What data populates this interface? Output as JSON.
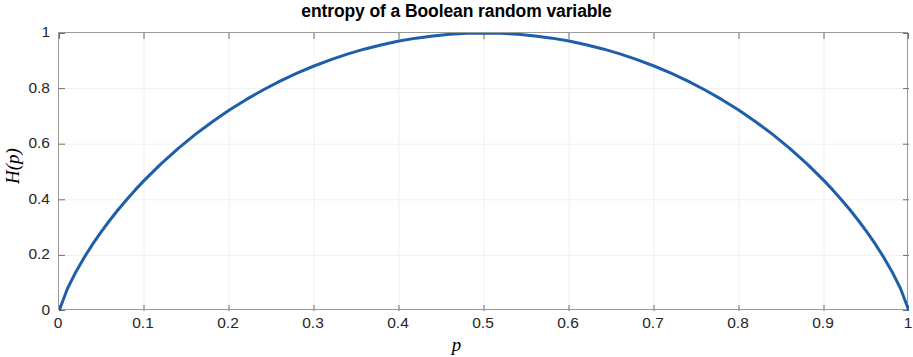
{
  "chart_data": {
    "type": "line",
    "title": "entropy of a Boolean random variable",
    "xlabel": "p",
    "ylabel": "H(p)",
    "xlim": [
      0,
      1
    ],
    "ylim": [
      0,
      1
    ],
    "grid": true,
    "legend": null,
    "line_color": "#1F5FA9",
    "line_width": 3,
    "xticks": [
      0,
      0.1,
      0.2,
      0.3,
      0.4,
      0.5,
      0.6,
      0.7,
      0.8,
      0.9,
      1
    ],
    "xticklabels": [
      "0",
      "0.1",
      "0.2",
      "0.3",
      "0.4",
      "0.5",
      "0.6",
      "0.7",
      "0.8",
      "0.9",
      "1"
    ],
    "yticks": [
      0,
      0.2,
      0.4,
      0.6,
      0.8,
      1
    ],
    "yticklabels": [
      "0",
      "0.2",
      "0.4",
      "0.6",
      "0.8",
      "1"
    ],
    "series": [
      {
        "name": "H(p)",
        "formula": "H(p) = -p*log2(p) - (1-p)*log2(1-p)",
        "x": [
          0,
          0.01,
          0.02,
          0.03,
          0.04,
          0.05,
          0.06,
          0.07,
          0.08,
          0.09,
          0.1,
          0.12,
          0.14,
          0.16,
          0.18,
          0.2,
          0.22,
          0.24,
          0.26,
          0.28,
          0.3,
          0.32,
          0.34,
          0.36,
          0.38,
          0.4,
          0.42,
          0.44,
          0.46,
          0.48,
          0.5,
          0.52,
          0.54,
          0.56,
          0.58,
          0.6,
          0.62,
          0.64,
          0.66,
          0.68,
          0.7,
          0.72,
          0.74,
          0.76,
          0.78,
          0.8,
          0.82,
          0.84,
          0.86,
          0.88,
          0.9,
          0.91,
          0.92,
          0.93,
          0.94,
          0.95,
          0.96,
          0.97,
          0.98,
          0.99,
          1
        ],
        "y": [
          0,
          0.0808,
          0.1414,
          0.1944,
          0.2423,
          0.2864,
          0.3274,
          0.3659,
          0.4022,
          0.4365,
          0.469,
          0.5294,
          0.5842,
          0.6343,
          0.6801,
          0.7219,
          0.7602,
          0.795,
          0.8267,
          0.8555,
          0.8813,
          0.9044,
          0.9249,
          0.9427,
          0.958,
          0.971,
          0.9815,
          0.9896,
          0.9954,
          0.9988,
          1,
          0.9988,
          0.9954,
          0.9896,
          0.9815,
          0.971,
          0.958,
          0.9427,
          0.9249,
          0.9044,
          0.8813,
          0.8555,
          0.8267,
          0.795,
          0.7602,
          0.7219,
          0.6801,
          0.6343,
          0.5842,
          0.5294,
          0.469,
          0.4365,
          0.4022,
          0.3659,
          0.3274,
          0.2864,
          0.2423,
          0.1944,
          0.1414,
          0.0808,
          0
        ]
      }
    ]
  },
  "axes": {
    "box_color": "#9a9a9a",
    "grid_color": "#f0f0f0",
    "tick_color": "#6e6e6e"
  }
}
